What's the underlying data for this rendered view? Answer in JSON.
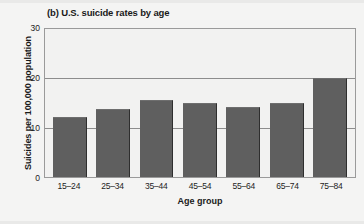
{
  "chart_data": {
    "type": "bar",
    "title": "(b) U.S. suicide rates by age",
    "xlabel": "Age group",
    "ylabel": "Suicides per 100,000 population",
    "categories": [
      "15–24",
      "25–34",
      "35–44",
      "45–54",
      "55–64",
      "65–74",
      "75–84"
    ],
    "values": [
      12.1,
      13.8,
      15.6,
      15.0,
      14.2,
      15.1,
      20.1
    ],
    "ylim": [
      0,
      30
    ],
    "yticks": [
      0,
      10,
      20,
      30
    ],
    "ytick_labels": [
      "0",
      "10",
      "20",
      "30"
    ],
    "grid": "horizontal",
    "legend": "none",
    "bar_color": "#5f5f5f",
    "plot_background": "#f2f2f1",
    "page_background": "#f4f4f3",
    "axis_color": "#9a9a9a"
  }
}
